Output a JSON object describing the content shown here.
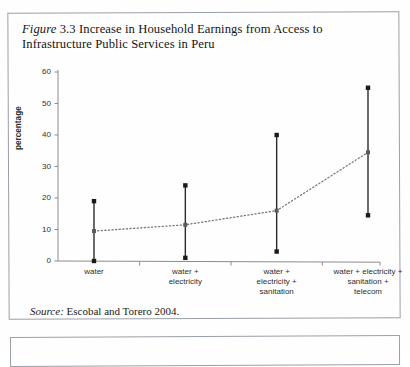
{
  "figure": {
    "label": "Figure",
    "number": "3.3",
    "caption": "Increase in Household Earnings from Access to Infrastructure Public Services in Peru",
    "caption_full": "Figure 3.3 Increase in Household Earnings from Access to Infrastructure Public Services in Peru"
  },
  "source_note": {
    "label": "Source:",
    "text": "Escobal and Torero 2004."
  },
  "chart_data": {
    "type": "line",
    "title": "Increase in Household Earnings from Access to Infrastructure Public Services in Peru",
    "xlabel": "",
    "ylabel": "percentage",
    "ylim": [
      0,
      60
    ],
    "yticks": [
      0,
      10,
      20,
      30,
      40,
      50,
      60
    ],
    "ytick_labels": [
      "0",
      "10",
      "20",
      "30",
      "40",
      "50",
      "60"
    ],
    "grid": false,
    "legend": "none",
    "categories": [
      "water",
      "water + electricity",
      "water + electricity + sanitation",
      "water + electricity + sanitation + telecom"
    ],
    "category_lines": [
      [
        "water"
      ],
      [
        "water +",
        "electricity"
      ],
      [
        "water +",
        "electricity +",
        "sanitation"
      ],
      [
        "water + electricity +",
        "sanitation +",
        "telecom"
      ]
    ],
    "series": [
      {
        "name": "mean increase in earnings",
        "style": "dotted-line-with-markers",
        "values": [
          9.5,
          11.5,
          16.0,
          34.5
        ]
      }
    ],
    "error_bars": {
      "style": "vertical-range-bar-with-square-caps",
      "lower": [
        0.0,
        1.0,
        3.0,
        14.5
      ],
      "upper": [
        19.0,
        24.0,
        40.0,
        55.0
      ]
    },
    "colors": {
      "axis": "#8c8c8c",
      "error_bar": "#2b2b2b",
      "marker": "#1a1a1a",
      "mean_marker": "#5a5a5a",
      "trend_line": "#7a7a7a"
    }
  }
}
